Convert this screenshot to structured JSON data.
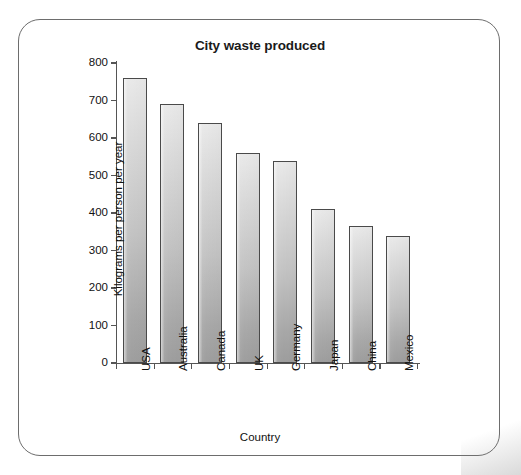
{
  "frame": {
    "border_color": "#6d6d6d",
    "background": "#ffffff"
  },
  "chart_data": {
    "type": "bar",
    "title": "City waste produced",
    "xlabel": "Country",
    "ylabel": "Kilograms per person per year",
    "categories": [
      "USA",
      "Australia",
      "Canada",
      "UK",
      "Germany",
      "Japan",
      "China",
      "Mexico"
    ],
    "values": [
      760,
      690,
      640,
      560,
      540,
      410,
      365,
      340
    ],
    "ylim": [
      0,
      800
    ],
    "ytick_values": [
      0,
      100,
      200,
      300,
      400,
      500,
      600,
      700,
      800
    ],
    "ytick_labels": [
      "0",
      "100",
      "200",
      "300",
      "400",
      "500",
      "600",
      "700",
      "800"
    ],
    "ytick_step": 100,
    "grid": false,
    "legend": null,
    "bar_fill_top": "#e9e9e9",
    "bar_fill_bottom": "#9e9e9e",
    "bar_edge_color": "#4a4a4a",
    "axis_color": "#555555",
    "xtick_label_rotation": -90
  }
}
